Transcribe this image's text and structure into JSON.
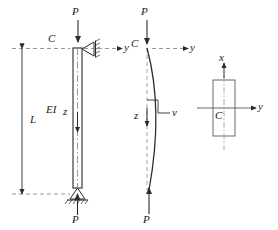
{
  "figure": {
    "stroke_color": "#2b2b2b",
    "dash_color": "#8a8a8a",
    "panels": [
      {
        "name": "ideal-column",
        "labels": {
          "load_top": "P",
          "load_bottom": "P",
          "centroid": "C",
          "axis_y": "y",
          "axis_z": "z",
          "length": "L",
          "rigidity": "EI"
        }
      },
      {
        "name": "buckled-column",
        "labels": {
          "load_top": "P",
          "load_bottom": "P",
          "centroid": "C",
          "axis_y": "y",
          "axis_z": "z",
          "deflection": "v"
        }
      },
      {
        "name": "cross-section",
        "labels": {
          "axis_x": "x",
          "axis_y": "y",
          "centroid": "C"
        }
      }
    ]
  },
  "annotations": {
    "p_top_left": "P",
    "p_bottom_left": "P",
    "c_left": "C",
    "y_left": "y",
    "z_left": "z",
    "L": "L",
    "EI": "EI",
    "p_top_mid": "P",
    "p_bottom_mid": "P",
    "c_mid": "C",
    "y_mid": "y",
    "z_mid": "z",
    "v_mid": "v",
    "x_right": "x",
    "y_right": "y",
    "c_right": "C"
  }
}
